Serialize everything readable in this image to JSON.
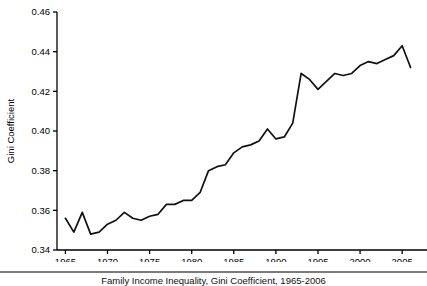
{
  "figure": {
    "caption": "Family Income Inequality, Gini Coefficient, 1965-2006",
    "background_color": "#ffffff",
    "line_color": "#111111",
    "rule_color": "#7a7a7a"
  },
  "chart_data": {
    "type": "line",
    "title": "",
    "xlabel": "",
    "ylabel": "Gini Coefficient",
    "xlim": [
      1964,
      2007
    ],
    "ylim": [
      0.34,
      0.46
    ],
    "grid": false,
    "legend": null,
    "x_ticks": [
      1965,
      1970,
      1975,
      1980,
      1985,
      1990,
      1995,
      2000,
      2005
    ],
    "x_tick_labels": [
      "1965",
      "1970",
      "1975",
      "1980",
      "1985",
      "1990",
      "1995",
      "2000",
      "2005"
    ],
    "y_ticks": [
      0.34,
      0.36,
      0.38,
      0.4,
      0.42,
      0.44,
      0.46
    ],
    "y_tick_labels": [
      "0.34",
      "0.36",
      "0.38",
      "0.40",
      "0.42",
      "0.44",
      "0.46"
    ],
    "series": [
      {
        "name": "Gini Coefficient",
        "x": [
          1965,
          1966,
          1967,
          1968,
          1969,
          1970,
          1971,
          1972,
          1973,
          1974,
          1975,
          1976,
          1977,
          1978,
          1979,
          1980,
          1981,
          1982,
          1983,
          1984,
          1985,
          1986,
          1987,
          1988,
          1989,
          1990,
          1991,
          1992,
          1993,
          1994,
          1995,
          1996,
          1997,
          1998,
          1999,
          2000,
          2001,
          2002,
          2003,
          2004,
          2005,
          2006
        ],
        "values": [
          0.356,
          0.349,
          0.359,
          0.348,
          0.349,
          0.353,
          0.355,
          0.359,
          0.356,
          0.355,
          0.357,
          0.358,
          0.363,
          0.363,
          0.365,
          0.365,
          0.369,
          0.38,
          0.382,
          0.383,
          0.389,
          0.392,
          0.393,
          0.395,
          0.401,
          0.396,
          0.397,
          0.404,
          0.429,
          0.426,
          0.421,
          0.425,
          0.429,
          0.428,
          0.429,
          0.433,
          0.435,
          0.434,
          0.436,
          0.438,
          0.443,
          0.432
        ]
      }
    ]
  }
}
